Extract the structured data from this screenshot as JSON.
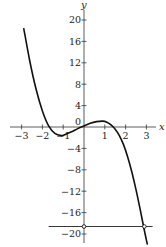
{
  "chart_data": {
    "type": "line",
    "title": "",
    "xlabel": "x",
    "ylabel": "y",
    "xlim": [
      -3.3,
      3.6
    ],
    "ylim": [
      -21.5,
      21.5
    ],
    "grid": false,
    "x_ticks": [
      -3,
      -2,
      -1,
      1,
      2,
      3
    ],
    "x_tick_labels": [
      "−3",
      "−2",
      "−1",
      "1",
      "2",
      "3"
    ],
    "y_ticks": [
      20,
      16,
      12,
      8,
      4,
      0,
      -4,
      -8,
      -12,
      -16,
      -20
    ],
    "y_tick_labels": [
      "20",
      "16",
      "12",
      "8",
      "4",
      "0",
      "−4",
      "−8",
      "−12",
      "−16",
      "−20"
    ],
    "series": [
      {
        "name": "curve",
        "x": [
          -2.9,
          -2.6,
          -2.3,
          -2.0,
          -1.7,
          -1.4,
          -1.1,
          -0.9,
          -0.6,
          -0.3,
          0.0,
          0.3,
          0.6,
          0.9,
          1.1,
          1.3,
          1.5,
          1.7,
          1.9,
          2.1,
          2.3,
          2.5,
          2.7,
          2.9,
          3.05
        ],
        "y": [
          18.5,
          12.2,
          7.0,
          3.0,
          0.2,
          -1.2,
          -1.6,
          -1.4,
          -0.9,
          -0.3,
          0.2,
          0.7,
          1.0,
          1.1,
          0.9,
          0.4,
          -0.4,
          -1.6,
          -3.3,
          -5.6,
          -8.4,
          -11.7,
          -15.4,
          -19.3,
          -22.0
        ]
      },
      {
        "name": "horizontal-line",
        "x": [
          -1.7,
          3.3
        ],
        "y": [
          -18.6,
          -18.6
        ]
      }
    ],
    "annotations": [
      {
        "type": "open-point",
        "x": 0,
        "y": -18.6
      },
      {
        "type": "open-point",
        "x": 2.9,
        "y": -18.6
      }
    ]
  }
}
